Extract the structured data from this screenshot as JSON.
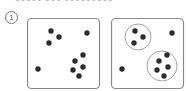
{
  "header": {
    "cut_off_text": "~~~~~ ~~~ ~~~~~~~~~"
  },
  "step": {
    "number": "1"
  },
  "colors": {
    "dot": "#2b2b2b",
    "box_stroke": "#8a8a8a",
    "circle_stroke": "#9a9a9a"
  },
  "panels": [
    {
      "name": "unclustered",
      "box": {
        "x": 27.5,
        "y": 18.5,
        "w": 72,
        "h": 70,
        "r": 4
      },
      "dots": [
        [
          51,
          31
        ],
        [
          59,
          37
        ],
        [
          49,
          43
        ],
        [
          87,
          33
        ],
        [
          38,
          69
        ],
        [
          83,
          55
        ],
        [
          75,
          61
        ],
        [
          83,
          67
        ],
        [
          73,
          70
        ],
        [
          79,
          76
        ]
      ],
      "clusters": []
    },
    {
      "name": "clustered",
      "box": {
        "x": 111.5,
        "y": 18.5,
        "w": 72,
        "h": 70,
        "r": 4
      },
      "dots": [
        [
          135,
          31
        ],
        [
          143,
          37
        ],
        [
          134,
          43
        ],
        [
          172,
          33
        ],
        [
          122,
          69
        ],
        [
          167,
          55
        ],
        [
          159,
          61
        ],
        [
          168,
          67
        ],
        [
          157,
          70
        ],
        [
          164,
          76
        ]
      ],
      "clusters": [
        {
          "cx": 138,
          "cy": 37,
          "r": 13
        },
        {
          "cx": 162,
          "cy": 66,
          "r": 15
        }
      ]
    }
  ]
}
